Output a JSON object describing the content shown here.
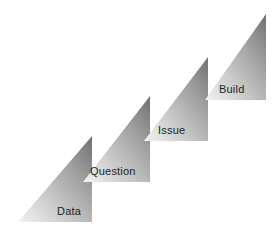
{
  "diagram": {
    "background_color": "#ffffff",
    "label_color": "#231f20",
    "gradient": {
      "light_color": "#f2f2f2",
      "mid_color": "#b5b5b5",
      "dark_color": "#6e6e6e",
      "direction": "bottom-left light to top-right dark"
    },
    "steps": [
      {
        "label": "Data",
        "index": 1,
        "apex": {
          "x": 92,
          "y": 136
        },
        "base_left": {
          "x": 18,
          "y": 222
        },
        "base_right": {
          "x": 92,
          "y": 222
        },
        "label_x": 57,
        "label_y": 205
      },
      {
        "label": "Question",
        "index": 2,
        "apex": {
          "x": 150,
          "y": 96
        },
        "base_left": {
          "x": 83,
          "y": 182
        },
        "base_right": {
          "x": 150,
          "y": 182
        },
        "label_x": 90,
        "label_y": 165
      },
      {
        "label": "Issue",
        "index": 3,
        "apex": {
          "x": 208,
          "y": 57
        },
        "base_left": {
          "x": 144,
          "y": 141
        },
        "base_right": {
          "x": 208,
          "y": 141
        },
        "label_x": 158,
        "label_y": 124
      },
      {
        "label": "Build",
        "index": 4,
        "apex": {
          "x": 266,
          "y": 14
        },
        "base_left": {
          "x": 205,
          "y": 100
        },
        "base_right": {
          "x": 266,
          "y": 100
        },
        "label_x": 219,
        "label_y": 83
      }
    ]
  }
}
